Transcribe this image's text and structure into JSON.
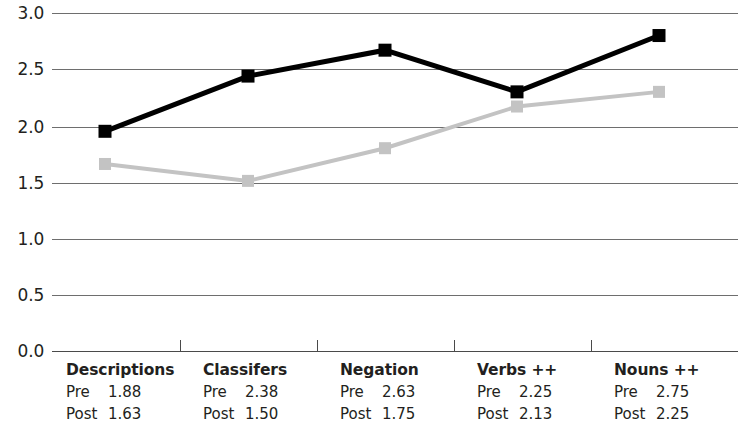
{
  "chart_data": {
    "type": "line",
    "title": "",
    "subtitle": "",
    "xlabel": "",
    "ylabel": "",
    "ylim": [
      0.0,
      3.0
    ],
    "grid": true,
    "legend_position": "none",
    "categories": [
      "Descriptions",
      "Classifers",
      "Negation",
      "Verbs ++",
      "Nouns ++"
    ],
    "y_ticks": [
      "0.0",
      "0.5",
      "1.0",
      "1.5",
      "2.0",
      "2.5",
      "3.0"
    ],
    "y_tick_values": [
      0.0,
      0.5,
      1.0,
      1.5,
      2.0,
      2.5,
      3.0
    ],
    "series": [
      {
        "name": "Pre",
        "color": "#000000",
        "marker": "square",
        "values": [
          1.95,
          2.44,
          2.67,
          2.3,
          2.8
        ],
        "table_values": [
          "1.88",
          "2.38",
          "2.63",
          "2.25",
          "2.75"
        ]
      },
      {
        "name": "Post",
        "color": "#c3c3c3",
        "marker": "square",
        "values": [
          1.66,
          1.51,
          1.8,
          2.17,
          2.3
        ],
        "table_values": [
          "1.63",
          "1.50",
          "1.75",
          "2.13",
          "2.25"
        ]
      }
    ],
    "data_table": [
      {
        "category": "Descriptions",
        "pre_label": "Pre",
        "pre": "1.88",
        "post_label": "Post",
        "post": "1.63"
      },
      {
        "category": "Classifers",
        "pre_label": "Pre",
        "pre": "2.38",
        "post_label": "Post",
        "post": "1.50"
      },
      {
        "category": "Negation",
        "pre_label": "Pre",
        "pre": "2.63",
        "post_label": "Post",
        "post": "1.75"
      },
      {
        "category": "Verbs ++",
        "pre_label": "Pre",
        "pre": "2.25",
        "post_label": "Post",
        "post": "2.13"
      },
      {
        "category": "Nouns ++",
        "pre_label": "Pre",
        "pre": "2.75",
        "post_label": "Post",
        "post": "2.25"
      }
    ],
    "colors": {
      "pre_series": "#000000",
      "post_series": "#c3c3c3",
      "gridline": "#6e6e6e",
      "axis": "#4a4a4a",
      "text": "#231f20",
      "background": "#ffffff"
    }
  },
  "y_axis": {
    "ticks": [
      {
        "label": "3.0",
        "top": 5
      },
      {
        "label": "2.5",
        "top": 61
      },
      {
        "label": "2.0",
        "top": 119
      },
      {
        "label": "1.5",
        "top": 175
      },
      {
        "label": "1.0",
        "top": 231
      },
      {
        "label": "0.5",
        "top": 287
      },
      {
        "label": "0.0",
        "top": 343
      }
    ]
  }
}
